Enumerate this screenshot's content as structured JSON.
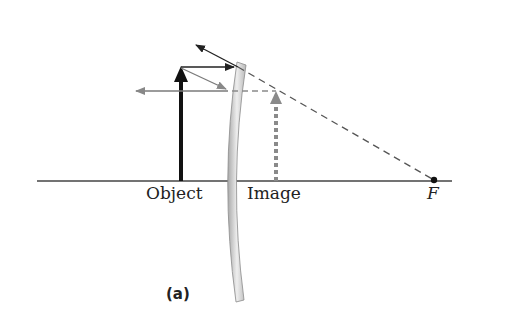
{
  "figure": {
    "labels": {
      "object": "Object",
      "image": "Image",
      "focal_point": "F",
      "panel": "(a)"
    },
    "colors": {
      "axis": "#444444",
      "object_arrow": "#111111",
      "image_arrow": "#8a8a8a",
      "ray_dark": "#222222",
      "ray_gray": "#7a7a7a",
      "extension_dashed": "#555555",
      "lens_fill": "#d8d8d8",
      "lens_edge": "#8a8a8a"
    },
    "elements": {
      "optical_axis": "horizontal line",
      "lens": "diverging lens (concave)",
      "object_arrow": "solid upright arrow",
      "image_arrow": "dashed virtual upright image arrow",
      "rays": [
        "parallel ray refracted away from axis",
        "central ray",
        "dashed extension to focal point F"
      ]
    }
  }
}
